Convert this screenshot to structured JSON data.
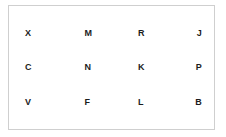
{
  "panel": {
    "border_color": "#cfcfcf",
    "background_color": "#ffffff"
  },
  "grid": {
    "text_color": "#1c1c1c",
    "rows": 3,
    "columns": 4,
    "cells": [
      [
        {
          "letter": "X"
        },
        {
          "letter": "M"
        },
        {
          "letter": "R"
        },
        {
          "letter": "J"
        }
      ],
      [
        {
          "letter": "C"
        },
        {
          "letter": "N"
        },
        {
          "letter": "K"
        },
        {
          "letter": "P"
        }
      ],
      [
        {
          "letter": "V"
        },
        {
          "letter": "F"
        },
        {
          "letter": "L"
        },
        {
          "letter": "B"
        }
      ]
    ]
  }
}
